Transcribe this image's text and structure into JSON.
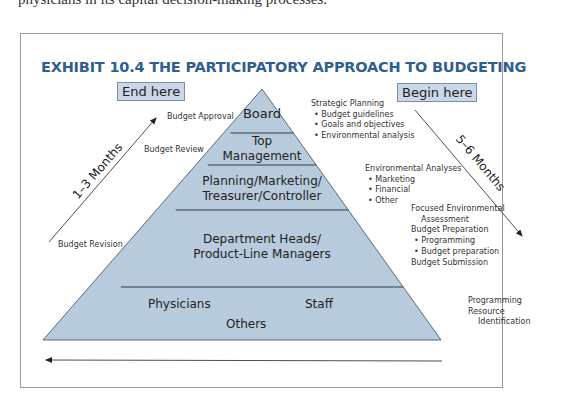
{
  "intro_text": "physicians in its capital decision-making processes.",
  "exhibit": {
    "title": "EXHIBIT 10.4  THE PARTICIPATORY APPROACH TO BUDGETING",
    "end_label": "End here",
    "begin_label": "Begin here",
    "left_duration": "1–3 Months",
    "right_duration": "5–6 Months",
    "colors": {
      "title": "#2f5f8f",
      "pyramid_fill": "#b8cbdc",
      "tag_fill": "#c9d7e6",
      "line": "#2b3a48"
    }
  },
  "pyramid": {
    "levels": [
      {
        "lines": [
          "Board"
        ]
      },
      {
        "lines": [
          "Top",
          "Management"
        ]
      },
      {
        "lines": [
          "Planning/Marketing/",
          "Treasurer/Controller"
        ]
      },
      {
        "lines": [
          "Department Heads/",
          "Product-Line Managers"
        ]
      },
      {
        "left": "Physicians",
        "right": "Staff",
        "bottom": "Others"
      }
    ]
  },
  "left_labels": {
    "approval": "Budget Approval",
    "review": "Budget Review",
    "revision": "Budget Revision"
  },
  "right_labels": {
    "strategic": {
      "heading": "Strategic Planning",
      "items": [
        "Budget guidelines",
        "Goals and objectives",
        "Environmental analysis"
      ]
    },
    "environmental": {
      "heading": "Environmental Analyses",
      "items": [
        "Marketing",
        "Financial",
        "Other"
      ]
    },
    "focused": {
      "line1": "Focused Environmental",
      "line2": "Assessment"
    },
    "preparation": {
      "heading": "Budget Preparation",
      "items": [
        "Programming",
        "Budget preparation"
      ]
    },
    "submission": "Budget Submission",
    "programming": {
      "line1": "Programming",
      "line2": "Resource",
      "line3": "Identification"
    }
  },
  "bullet": "•"
}
